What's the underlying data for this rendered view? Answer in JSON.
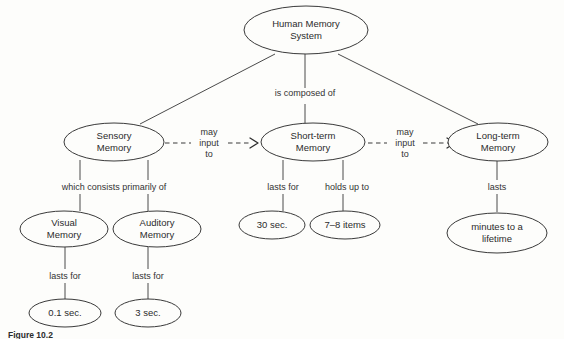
{
  "figure": {
    "caption": "Figure 10.2",
    "background_color": "#fdfdfb",
    "stroke_color": "#3a3a3a",
    "text_color": "#2b2b2b"
  },
  "nodes": {
    "root": {
      "line1": "Human Memory",
      "line2": "System"
    },
    "sensory": {
      "line1": "Sensory",
      "line2": "Memory"
    },
    "short_term": {
      "line1": "Short-term",
      "line2": "Memory"
    },
    "long_term": {
      "line1": "Long-term",
      "line2": "Memory"
    },
    "visual": {
      "line1": "Visual",
      "line2": "Memory"
    },
    "auditory": {
      "line1": "Auditory",
      "line2": "Memory"
    },
    "visual_duration": {
      "line1": "0.1 sec.",
      "line2": ""
    },
    "auditory_duration": {
      "line1": "3 sec.",
      "line2": ""
    },
    "short_term_duration": {
      "line1": "30 sec.",
      "line2": ""
    },
    "short_term_capacity": {
      "line1": "7–8 items",
      "line2": ""
    },
    "long_term_duration": {
      "line1": "minutes to a",
      "line2": "lifetime"
    }
  },
  "edges": {
    "is_composed_of": "is composed of",
    "which_consists_primarily_of": "which consists primarily of",
    "may_input_to_1": {
      "line1": "may",
      "line2": "input",
      "line3": "to"
    },
    "may_input_to_2": {
      "line1": "may",
      "line2": "input",
      "line3": "to"
    },
    "lasts_for_visual": "lasts for",
    "lasts_for_auditory": "lasts for",
    "lasts_for_short_term": "lasts for",
    "holds_up_to": "holds up to",
    "lasts_long_term": "lasts"
  }
}
